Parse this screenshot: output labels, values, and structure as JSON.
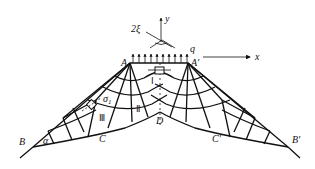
{
  "diagram": {
    "type": "slip-line field",
    "labels": {
      "A": "A",
      "A_prime": "A'",
      "B": "B",
      "B_prime": "B'",
      "C": "C",
      "C_prime": "C'",
      "D": "D",
      "q": "q",
      "x_axis": "x",
      "y_axis": "y",
      "two_xi": "2ξ",
      "alpha": "α",
      "sigma1": "σ",
      "sigma1_sub": "1"
    },
    "regions": {
      "region_1": "Ⅰ",
      "region_2": "Ⅱ",
      "region_3": "Ⅲ"
    },
    "colors": {
      "line": "#111111",
      "background": "#ffffff"
    }
  }
}
